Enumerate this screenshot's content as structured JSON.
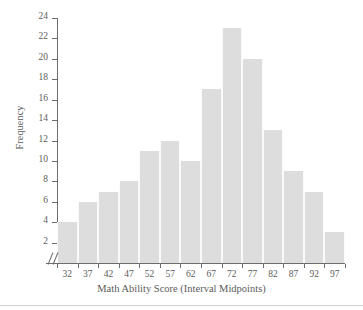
{
  "chart_data": {
    "type": "bar",
    "title": "",
    "xlabel": "Math Ability Score (Interval Midpoints)",
    "ylabel": "Frequency",
    "categories": [
      "32",
      "37",
      "42",
      "47",
      "52",
      "57",
      "62",
      "67",
      "72",
      "77",
      "82",
      "87",
      "92",
      "97"
    ],
    "values": [
      4,
      6,
      7,
      8,
      11,
      12,
      10,
      17,
      23,
      20,
      13,
      9,
      7,
      3
    ],
    "ylim": [
      0,
      24
    ],
    "yticks": [
      2,
      4,
      6,
      8,
      10,
      12,
      14,
      16,
      18,
      20,
      22,
      24
    ],
    "xtick_labels": [
      "32",
      "37",
      "42",
      "47",
      "52",
      "57",
      "62",
      "67",
      "72",
      "77",
      "82",
      "87",
      "92",
      "97"
    ],
    "grid": false,
    "legend": "none",
    "bar_color": "#dddddd",
    "axis_color": "#6d6d6d",
    "text_color": "#5b5b5b",
    "axis_break": "//",
    "background": "#ffffff"
  }
}
